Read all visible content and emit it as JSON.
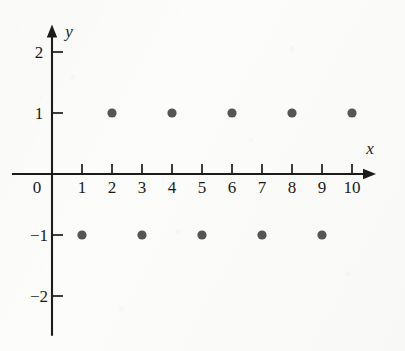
{
  "chart_data": {
    "type": "scatter",
    "title": "",
    "xlabel": "x",
    "ylabel": "y",
    "xlim": [
      0,
      10.8
    ],
    "ylim": [
      -2.65,
      2.45
    ],
    "grid": false,
    "legend": null,
    "x_ticks": [
      1,
      2,
      3,
      4,
      5,
      6,
      7,
      8,
      9,
      10
    ],
    "x_tick_labels": [
      "1",
      "2",
      "3",
      "4",
      "5",
      "6",
      "7",
      "8",
      "9",
      "10"
    ],
    "y_ticks": [
      2,
      1,
      -1,
      -2
    ],
    "y_tick_labels": [
      "2",
      "1",
      "−1",
      "−2"
    ],
    "origin_label": "0",
    "point_color": "#555555",
    "axis_color": "#1c1c1c",
    "background_color": "#fcfcfb",
    "series": [
      {
        "name": "points",
        "points": [
          {
            "x": 1,
            "y": -1
          },
          {
            "x": 2,
            "y": 1
          },
          {
            "x": 3,
            "y": -1
          },
          {
            "x": 4,
            "y": 1
          },
          {
            "x": 5,
            "y": -1
          },
          {
            "x": 6,
            "y": 1
          },
          {
            "x": 7,
            "y": -1
          },
          {
            "x": 8,
            "y": 1
          },
          {
            "x": 9,
            "y": -1
          },
          {
            "x": 10,
            "y": 1
          }
        ]
      }
    ],
    "x": [
      1,
      2,
      3,
      4,
      5,
      6,
      7,
      8,
      9,
      10
    ],
    "values": [
      -1,
      1,
      -1,
      1,
      -1,
      1,
      -1,
      1,
      -1,
      1
    ]
  }
}
